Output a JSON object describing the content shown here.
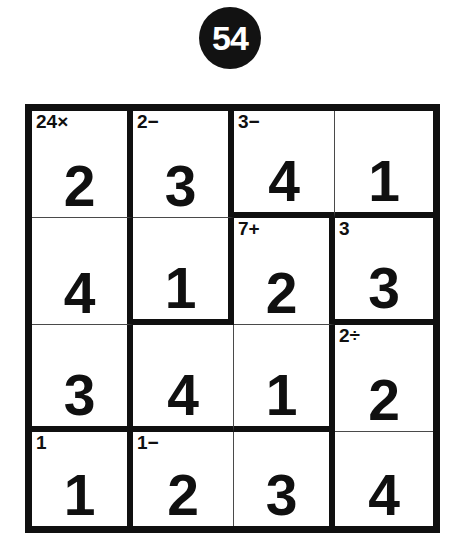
{
  "badge": {
    "label": "54",
    "bg_color": "#121212",
    "text_color": "#ffffff"
  },
  "puzzle": {
    "type": "kenken",
    "size": 4,
    "colors": {
      "cage_border": "#101010",
      "cell_border": "#4a4a4a",
      "cell_background": "#ffffff",
      "digit_color": "#101010"
    },
    "cages": [
      {
        "id": "cage-24x",
        "label": "24×",
        "operation": "multiply",
        "target": 24,
        "cells": [
          "r1c1",
          "r2c1",
          "r3c1"
        ]
      },
      {
        "id": "cage-2minus",
        "label": "2−",
        "operation": "subtract",
        "target": 2,
        "cells": [
          "r1c2",
          "r2c2"
        ]
      },
      {
        "id": "cage-3minus",
        "label": "3−",
        "operation": "subtract",
        "target": 3,
        "cells": [
          "r1c3",
          "r1c4"
        ]
      },
      {
        "id": "cage-7plus",
        "label": "7+",
        "operation": "add",
        "target": 7,
        "cells": [
          "r2c3",
          "r3c3",
          "r3c2"
        ]
      },
      {
        "id": "cage-3",
        "label": "3",
        "operation": "none",
        "target": 3,
        "cells": [
          "r2c4"
        ]
      },
      {
        "id": "cage-2div",
        "label": "2÷",
        "operation": "divide",
        "target": 2,
        "cells": [
          "r3c4",
          "r4c4"
        ]
      },
      {
        "id": "cage-1",
        "label": "1",
        "operation": "none",
        "target": 1,
        "cells": [
          "r4c1"
        ]
      },
      {
        "id": "cage-1minus",
        "label": "1−",
        "operation": "subtract",
        "target": 1,
        "cells": [
          "r4c2",
          "r4c3"
        ]
      }
    ],
    "rows": [
      {
        "row": 1,
        "cells": [
          {
            "id": "r1c1",
            "value": "2",
            "cage_label": "24×"
          },
          {
            "id": "r1c2",
            "value": "3",
            "cage_label": "2−"
          },
          {
            "id": "r1c3",
            "value": "4",
            "cage_label": "3−"
          },
          {
            "id": "r1c4",
            "value": "1",
            "cage_label": ""
          }
        ]
      },
      {
        "row": 2,
        "cells": [
          {
            "id": "r2c1",
            "value": "4",
            "cage_label": ""
          },
          {
            "id": "r2c2",
            "value": "1",
            "cage_label": ""
          },
          {
            "id": "r2c3",
            "value": "2",
            "cage_label": "7+"
          },
          {
            "id": "r2c4",
            "value": "3",
            "cage_label": "3"
          }
        ]
      },
      {
        "row": 3,
        "cells": [
          {
            "id": "r3c1",
            "value": "3",
            "cage_label": ""
          },
          {
            "id": "r3c2",
            "value": "4",
            "cage_label": ""
          },
          {
            "id": "r3c3",
            "value": "1",
            "cage_label": ""
          },
          {
            "id": "r3c4",
            "value": "2",
            "cage_label": "2÷"
          }
        ]
      },
      {
        "row": 4,
        "cells": [
          {
            "id": "r4c1",
            "value": "1",
            "cage_label": "1"
          },
          {
            "id": "r4c2",
            "value": "2",
            "cage_label": "1−"
          },
          {
            "id": "r4c3",
            "value": "3",
            "cage_label": ""
          },
          {
            "id": "r4c4",
            "value": "4",
            "cage_label": ""
          }
        ]
      }
    ]
  }
}
